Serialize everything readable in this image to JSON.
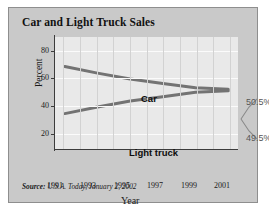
{
  "figure": {
    "title": "Car and Light Truck Sales",
    "source_label": "Source:",
    "source_text": " U.S.A. Today, January 2, 2002"
  },
  "chart_data": {
    "type": "line",
    "title": "Car and Light Truck Sales",
    "xlabel": "Year",
    "ylabel": "Percent",
    "x": [
      1991,
      1993,
      1995,
      1997,
      1999,
      2001
    ],
    "xlim": [
      1990.4,
      2001.6
    ],
    "ylim": [
      10,
      86
    ],
    "xtick_labels": [
      "1991",
      "1993",
      "1995",
      "1997",
      "1999",
      "2001"
    ],
    "ytick_labels": [
      "20",
      "40",
      "60",
      "80"
    ],
    "yticks": [
      20,
      40,
      60,
      80
    ],
    "grid": "vertical and horizontal gridlines",
    "legend": "inline series labels",
    "series": [
      {
        "name": "Car",
        "label": "Car",
        "color": "#737373",
        "values": [
          66.0,
          61.5,
          57.5,
          54.5,
          51.5,
          50.5
        ],
        "end_annotation": "50.5%"
      },
      {
        "name": "Light truck",
        "label": "Light truck",
        "color": "#737373",
        "values": [
          34.0,
          38.5,
          42.5,
          45.5,
          48.5,
          49.5
        ],
        "end_annotation": "49.5%"
      }
    ],
    "annotations": [
      {
        "text": "50.5%",
        "series": "Car"
      },
      {
        "text": "49.5%",
        "series": "Light truck"
      }
    ]
  }
}
